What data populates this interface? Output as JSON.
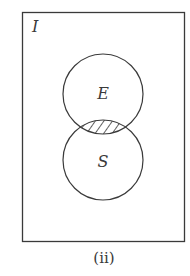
{
  "diagram": {
    "type": "venn",
    "universe_label": "I",
    "sets": [
      {
        "label": "E",
        "position": "top"
      },
      {
        "label": "S",
        "position": "bottom"
      }
    ],
    "shaded_region": "E ∩ S",
    "caption": "(ii)",
    "colors": {
      "stroke": "#3a3a3a",
      "background": "#ffffff"
    }
  }
}
